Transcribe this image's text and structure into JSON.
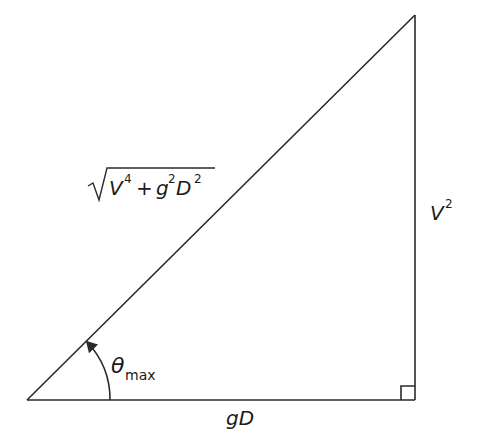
{
  "diagram": {
    "type": "right-triangle",
    "hypotenuse_label": {
      "radical": "√",
      "v": "V",
      "v_exp": "4",
      "plus": "+",
      "g": "g",
      "g_exp": "2",
      "d": "D",
      "d_exp": "2"
    },
    "vertical_side_label": {
      "v": "V",
      "exp": "2"
    },
    "base_label": "gD",
    "angle_label": {
      "symbol": "θ",
      "subscript": "max"
    },
    "right_angle_marker": true,
    "colors": {
      "stroke": "#2a2a2a",
      "text": "#1a1a1a",
      "background": "#ffffff"
    }
  }
}
